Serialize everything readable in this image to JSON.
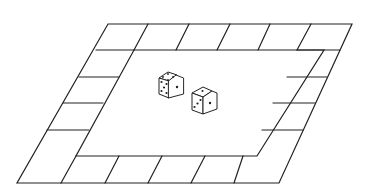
{
  "diagram": {
    "type": "board-game-illustration",
    "board": {
      "shape": "parallelogram",
      "outer_corners": {
        "top_left": [
          108,
          24
        ],
        "top_right": [
          352,
          24
        ],
        "bottom_right": [
          279,
          183
        ],
        "bottom_left": [
          17,
          183
        ]
      },
      "track_squares": {
        "top_row": 6,
        "bottom_row": 6,
        "left_column_inner": 4,
        "right_column_inner": 4
      },
      "line_color": "#222222",
      "background": "#ffffff"
    },
    "dice": [
      {
        "name": "die-1",
        "top_face": 4,
        "front_face": 5,
        "right_face": 1
      },
      {
        "name": "die-2",
        "top_face": 1,
        "front_face": 3,
        "right_face": 1
      }
    ]
  }
}
